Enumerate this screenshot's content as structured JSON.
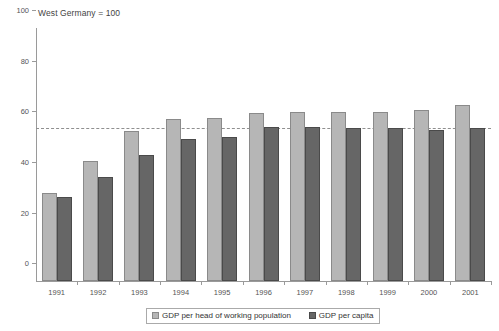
{
  "chart_data": {
    "type": "bar",
    "title": "West Germany = 100",
    "xlabel": "",
    "ylabel": "",
    "ylim": [
      0,
      100
    ],
    "yticks": [
      0,
      20,
      40,
      60,
      80,
      100
    ],
    "grid": false,
    "legend_position": "bottom",
    "reference_line": {
      "value": 60,
      "style": "dashed",
      "color": "#8f8f8f"
    },
    "categories": [
      "1991",
      "1992",
      "1993",
      "1994",
      "1995",
      "1996",
      "1997",
      "1998",
      "1999",
      "2000",
      "2001"
    ],
    "series": [
      {
        "name": "GDP per head of working population",
        "color": "#b6b6b6",
        "values": [
          34.8,
          47.4,
          59.3,
          64.0,
          64.5,
          66.5,
          67.0,
          66.8,
          67.0,
          67.5,
          69.5
        ]
      },
      {
        "name": "GDP per capita",
        "color": "#666666",
        "values": [
          33.2,
          41.0,
          49.8,
          56.0,
          57.0,
          60.8,
          61.0,
          60.5,
          60.3,
          59.8,
          60.3
        ]
      }
    ]
  },
  "axis": {
    "y_tick_labels": [
      "0",
      "20",
      "40",
      "60",
      "80",
      "100"
    ],
    "x_tick_labels": [
      "1991",
      "1992",
      "1993",
      "1994",
      "1995",
      "1996",
      "1997",
      "1998",
      "1999",
      "2000",
      "2001"
    ]
  },
  "legend": {
    "entries": [
      {
        "label": "GDP per head of working population",
        "swatch": "light"
      },
      {
        "label": "GDP per capita",
        "swatch": "dark"
      }
    ]
  }
}
